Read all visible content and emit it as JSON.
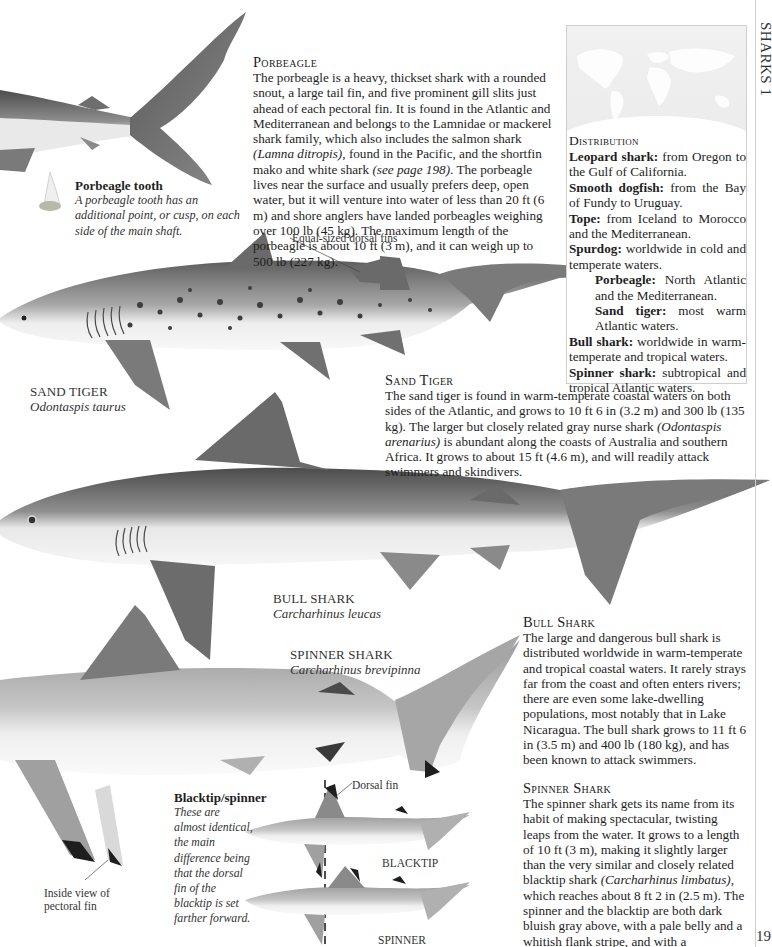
{
  "page": {
    "running_head": "SHARKS 1",
    "page_number": "19"
  },
  "porbeagle": {
    "title": "Porbeagle",
    "text_parts": [
      "The porbeagle is a heavy, thickset shark with a rounded snout, a large tail fin, and five prominent gill slits just ahead of each pectoral fin. It is found in the Atlantic and Mediterranean and belongs to the Lamnidae or mackerel shark family, which also includes the salmon shark ",
      "(Lamna ditropis)",
      ", found in the Pacific, and the shortfin mako and white shark ",
      "(see page 198)",
      ". The porbeagle lives near the surface and usually prefers deep, open water, but it will venture into water of less than 20 ft (6 m) and shore anglers have landed porbeagles weighing over 100 lb (45 kg). The maximum length of the porbeagle is about 10 ft (3 m), and it can weigh up to 500 lb (227 kg)."
    ],
    "tooth_note": {
      "title": "Porbeagle tooth",
      "text": "A porbeagle tooth has an additional point, or cusp, on each side of the main shaft."
    }
  },
  "distribution": {
    "title": "Distribution",
    "entries": [
      {
        "name": "Leopard shark:",
        "range": " from Oregon to the Gulf of California."
      },
      {
        "name": "Smooth dogfish:",
        "range": " from the Bay of Fundy to Uruguay."
      },
      {
        "name": "Tope:",
        "range": " from Iceland to Morocco and the Mediterranean."
      },
      {
        "name": "Spurdog:",
        "range": " worldwide in cold and temperate waters."
      },
      {
        "name": "Porbeagle:",
        "range": " North Atlantic and the Mediterranean."
      },
      {
        "name": "Sand tiger:",
        "range": " most warm Atlantic waters."
      },
      {
        "name": "Bull shark:",
        "range": " worldwide in warm-temperate and tropical waters."
      },
      {
        "name": "Spinner shark:",
        "range": " subtropical and tropical Atlantic waters."
      }
    ]
  },
  "sand_tiger": {
    "caption_name": "Sand Tiger",
    "caption_latin": "Odontaspis taurus",
    "fin_label": "Equal-sized dorsal fins",
    "title": "Sand Tiger",
    "text_parts": [
      "The sand tiger is found in warm-temperate coastal waters on both sides of the Atlantic, and grows to 10 ft 6 in (3.2 m) and 300 lb (135 kg). The larger but closely related gray nurse shark ",
      "(Odontaspis arenarius)",
      " is abundant along the coasts of Australia and southern Africa. It grows to about 15 ft (4.6 m), and will readily attack swimmers and skindivers."
    ]
  },
  "bull_shark": {
    "caption_name": "Bull Shark",
    "caption_latin": "Carcharhinus leucas",
    "title": "Bull Shark",
    "text": "The large and dangerous bull shark is distributed worldwide in warm-temperate and tropical coastal waters. It rarely strays far from the coast and often enters rivers; there are even some lake-dwelling populations, most notably that in Lake Nicaragua. The bull shark grows to 11 ft 6 in (3.5 m) and 400 lb (180 kg), and has been known to attack swimmers."
  },
  "spinner_shark": {
    "caption_name": "Spinner Shark",
    "caption_latin": "Carcharhinus brevipinna",
    "pectoral_label": "Inside view of pectoral fin",
    "title": "Spinner Shark",
    "text_parts": [
      "The spinner shark gets its name from its habit of making spectacular, twisting leaps from the water. It grows to a length of 10 ft (3 m), making it slightly larger than the very similar and closely related blacktip shark ",
      "(Carcharhinus limbatus)",
      ", which reaches about 8 ft 2 in (2.5 m). The spinner and the blacktip are both dark bluish gray above, with a pale belly and a whitish flank stripe, and with a conspicuous black tip to the inside of each pectoral fin."
    ],
    "comparison": {
      "title": "Blacktip/spinner",
      "text": "These are almost identical, the main difference being that the dorsal fin of the blacktip is set farther forward.",
      "dorsal_label": "Dorsal fin",
      "label_top": "BLACKTIP",
      "label_bottom": "SPINNER"
    }
  },
  "colors": {
    "shark_dark": "#4a4a4a",
    "shark_mid": "#8a8a8a",
    "shark_light": "#d9d9d9",
    "belly": "#f4f4f4",
    "spots": "#3a3a3a"
  }
}
